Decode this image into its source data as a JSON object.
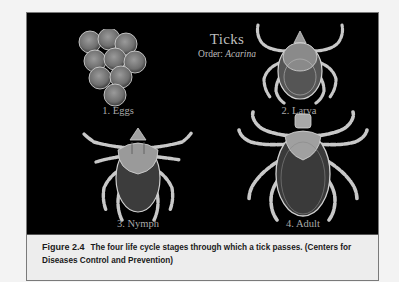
{
  "figure": {
    "panel": {
      "title": "Ticks",
      "subtitle_prefix": "Order: ",
      "subtitle_taxon": "Acarina",
      "stages": [
        {
          "label": "1. Eggs",
          "icon": "tick-eggs-illustration"
        },
        {
          "label": "2. Larva",
          "icon": "tick-larva-illustration"
        },
        {
          "label": "3. Nymph",
          "icon": "tick-nymph-illustration"
        },
        {
          "label": "4. Adult",
          "icon": "tick-adult-illustration"
        }
      ]
    },
    "caption": {
      "number": "Figure 2.4",
      "text": "The four life cycle stages through which a tick passes.  (Centers for Diseases Control and Prevention)"
    }
  },
  "colors": {
    "page_background": "#f3f3f3",
    "panel_background": "#000000",
    "caption_background": "#ededed",
    "label_text": "#a9a9a9",
    "illustration": "#c8c8c8"
  }
}
